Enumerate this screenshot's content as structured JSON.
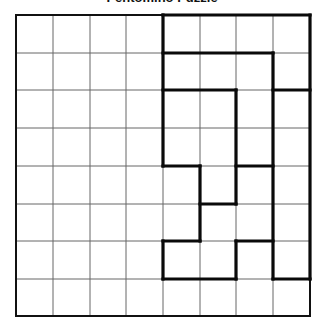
{
  "title": "Pentomino Puzzle",
  "grid": {
    "rows": 8,
    "cols": 8,
    "col_lines_x": [
      16,
      53,
      90,
      126,
      163,
      200,
      236,
      273,
      310
    ],
    "row_lines_y": [
      15,
      53,
      90,
      128,
      166,
      204,
      241,
      279,
      316
    ],
    "thin_line_color": "#666666",
    "border_color": "#111111",
    "thick_line_color": "#0a0a0a"
  },
  "thick_segments": [
    {
      "type": "h",
      "line": 0,
      "from": 4,
      "to": 8
    },
    {
      "type": "v",
      "line": 8,
      "from": 0,
      "to": 7
    },
    {
      "type": "v",
      "line": 4,
      "from": 0,
      "to": 4
    },
    {
      "type": "h",
      "line": 1,
      "from": 4,
      "to": 7
    },
    {
      "type": "v",
      "line": 7,
      "from": 1,
      "to": 7
    },
    {
      "type": "h",
      "line": 2,
      "from": 7,
      "to": 8
    },
    {
      "type": "h",
      "line": 2,
      "from": 4,
      "to": 6
    },
    {
      "type": "v",
      "line": 6,
      "from": 2,
      "to": 5
    },
    {
      "type": "h",
      "line": 4,
      "from": 4,
      "to": 5
    },
    {
      "type": "v",
      "line": 5,
      "from": 4,
      "to": 6
    },
    {
      "type": "h",
      "line": 5,
      "from": 5,
      "to": 6
    },
    {
      "type": "h",
      "line": 4,
      "from": 6,
      "to": 7
    },
    {
      "type": "h",
      "line": 6,
      "from": 4,
      "to": 5
    },
    {
      "type": "v",
      "line": 4,
      "from": 6,
      "to": 7
    },
    {
      "type": "h",
      "line": 7,
      "from": 4,
      "to": 6
    },
    {
      "type": "v",
      "line": 6,
      "from": 6,
      "to": 7
    },
    {
      "type": "h",
      "line": 6,
      "from": 6,
      "to": 7
    },
    {
      "type": "h",
      "line": 7,
      "from": 7,
      "to": 8
    }
  ]
}
